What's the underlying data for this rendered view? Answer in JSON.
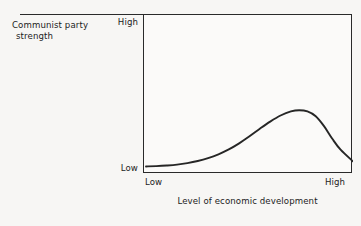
{
  "figure": {
    "background_color": "#f7f6f4",
    "ink_color": "#2a2a2a"
  },
  "axes": {
    "y_caption_line1": "Communist party",
    "y_caption_line2": "strength",
    "y_tick_high": "High",
    "y_tick_low": "Low",
    "x_tick_low": "Low",
    "x_tick_high": "High",
    "x_caption": "Level of economic development"
  },
  "chart_data": {
    "type": "line",
    "title": "",
    "xlabel": "Level of economic development",
    "ylabel": "Communist party strength",
    "xlim": [
      0,
      1
    ],
    "ylim": [
      0,
      1
    ],
    "xtick_labels": [
      "Low",
      "High"
    ],
    "ytick_labels": [
      "Low",
      "High"
    ],
    "grid": false,
    "legend": false,
    "annotations": [],
    "series": [
      {
        "name": "Communist party strength",
        "description": "Right-skewed bell curve: flat and low at low development, gradual rise, peak at roughly 74% of the way along the x axis at about 40% of the plot height, then a steep decline to a slightly elevated level at high development.",
        "x": [
          0.0,
          0.05,
          0.1,
          0.15,
          0.2,
          0.25,
          0.3,
          0.35,
          0.4,
          0.45,
          0.5,
          0.55,
          0.6,
          0.65,
          0.7,
          0.74,
          0.78,
          0.82,
          0.86,
          0.9,
          0.94,
          1.0
        ],
        "y": [
          0.03,
          0.032,
          0.036,
          0.042,
          0.052,
          0.066,
          0.085,
          0.11,
          0.142,
          0.182,
          0.228,
          0.278,
          0.325,
          0.365,
          0.392,
          0.4,
          0.392,
          0.36,
          0.295,
          0.212,
          0.14,
          0.063
        ]
      }
    ]
  }
}
